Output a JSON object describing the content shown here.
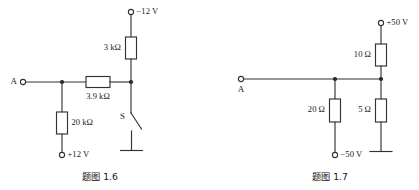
{
  "page": {
    "background": "#ffffff",
    "ink_color": "#333333",
    "width": 419,
    "height": 190
  },
  "figures": [
    {
      "id": "fig-1-6",
      "caption": "题图 1.6",
      "caption_label": "题图",
      "caption_number": "1.6",
      "node_terminal_label": "A",
      "switch_label": "S",
      "supply_top": "−12 V",
      "supply_bottom": "+12 V",
      "components": [
        {
          "name": "resistor-3k",
          "label": "3 kΩ",
          "value": "3",
          "unit": "kΩ",
          "orientation": "vertical"
        },
        {
          "name": "resistor-3p9k",
          "label": "3.9 kΩ",
          "value": "3.9",
          "unit": "kΩ",
          "orientation": "horizontal"
        },
        {
          "name": "resistor-20k",
          "label": "20 kΩ",
          "value": "20",
          "unit": "kΩ",
          "orientation": "vertical"
        }
      ],
      "has_ground": true,
      "has_switch": true
    },
    {
      "id": "fig-1-7",
      "caption": "题图 1.7",
      "caption_label": "题图",
      "caption_number": "1.7",
      "node_terminal_label": "A",
      "supply_top": "+50 V",
      "supply_bottom": "−50 V",
      "components": [
        {
          "name": "resistor-10",
          "label": "10 Ω",
          "value": "10",
          "unit": "Ω",
          "orientation": "vertical"
        },
        {
          "name": "resistor-20",
          "label": "20 Ω",
          "value": "20",
          "unit": "Ω",
          "orientation": "vertical"
        },
        {
          "name": "resistor-5",
          "label": "5 Ω",
          "value": "5",
          "unit": "Ω",
          "orientation": "vertical"
        }
      ],
      "has_ground": true,
      "has_switch": false
    }
  ]
}
